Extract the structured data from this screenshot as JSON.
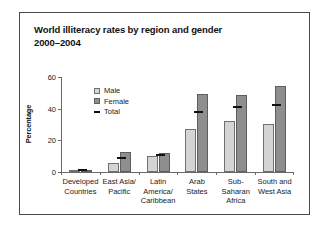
{
  "chart_data": {
    "type": "bar",
    "title": "World illiteracy rates by region and gender",
    "subtitle": "2000–2004",
    "xlabel": "",
    "ylabel": "Percentage",
    "ylim": [
      0,
      60
    ],
    "yticks": [
      0,
      20,
      40,
      60
    ],
    "ytick_labels": [
      "0",
      "20",
      "40",
      "60"
    ],
    "grid": false,
    "legend_position": "top-left",
    "categories": [
      "Developed\nCountries",
      "East Asia/\nPacific",
      "Latin\nAmerica/\nCaribbean",
      "Arab\nStates",
      "Sub-\nSaharan\nAfrica",
      "South and\nWest Asia"
    ],
    "series": [
      {
        "name": "Male",
        "type": "bar",
        "color": "#d4d4d4",
        "values": [
          1.0,
          5.5,
          10.0,
          27.0,
          32.5,
          30.5
        ]
      },
      {
        "name": "Female",
        "type": "bar",
        "color": "#8e8e8e",
        "values": [
          1.2,
          12.5,
          12.0,
          49.0,
          48.5,
          54.5
        ]
      },
      {
        "name": "Total",
        "type": "marker",
        "color": "#111111",
        "values": [
          1.1,
          9.0,
          11.0,
          38.0,
          41.0,
          42.5
        ]
      }
    ]
  },
  "legend": {
    "items": [
      {
        "label": "Male"
      },
      {
        "label": "Female"
      },
      {
        "label": "Total"
      }
    ]
  }
}
